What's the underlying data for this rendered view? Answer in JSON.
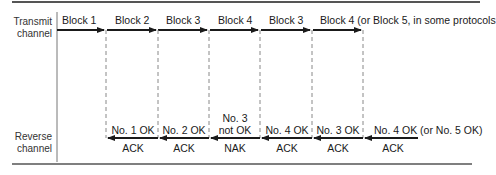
{
  "axis_labels": {
    "transmit": [
      "Transmit",
      "channel"
    ],
    "reverse": [
      "Reverse",
      "channel"
    ]
  },
  "transmit_blocks": [
    {
      "label": "Block 1"
    },
    {
      "label": "Block 2"
    },
    {
      "label": "Block 3"
    },
    {
      "label": "Block 4"
    },
    {
      "label": "Block 3"
    },
    {
      "label": "Block 4 (or Block 5, in some protocols"
    }
  ],
  "reverse_messages": [
    {
      "status": "No. 1 OK",
      "type": "ACK"
    },
    {
      "status": "No. 2 OK",
      "type": "ACK"
    },
    {
      "status_line1": "No. 3",
      "status_line2": "not OK",
      "type": "NAK"
    },
    {
      "status": "No. 4 OK",
      "type": "ACK"
    },
    {
      "status": "No. 3 OK",
      "type": "ACK"
    },
    {
      "status": "No. 4 OK (or No. 5 OK)",
      "type": "ACK"
    }
  ],
  "colors": {
    "line": "#1a1a1a",
    "dashed": "#888888",
    "rule": "#444444"
  }
}
